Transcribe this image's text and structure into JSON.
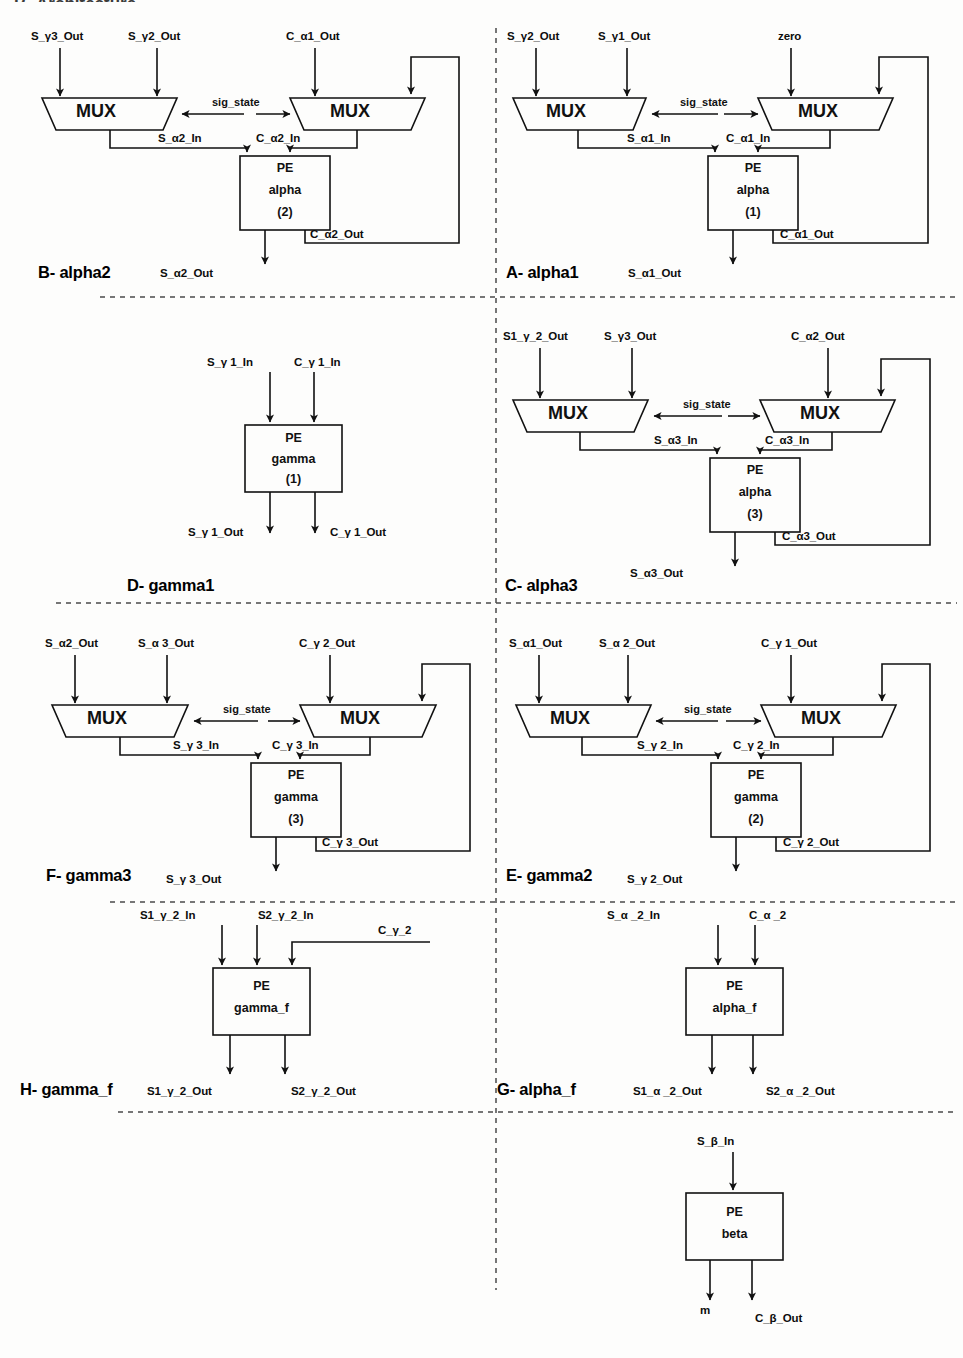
{
  "figure": {
    "title_clipped": "B-  Architecture",
    "background": "#fdfdfc",
    "line_color": "#111111",
    "divider_color": "#444444",
    "width": 963,
    "height": 1358
  },
  "common": {
    "mux_label": "MUX",
    "sig_state": "sig_state",
    "pe_label": "PE"
  },
  "panels": [
    {
      "id": "B",
      "name": "B- alpha2",
      "pe": {
        "line1": "PE",
        "line2": "alpha",
        "line3": "(2)"
      },
      "inputs_left_mux": [
        "S_γ3_Out",
        "S_γ2_Out"
      ],
      "inputs_right_mux": [
        "C_α1_Out"
      ],
      "mux_select": "sig_state",
      "pe_in_left": "S_α2_In",
      "pe_in_right": "C_α2_In",
      "pe_out_sum": "S_α2_Out",
      "pe_out_carry": "C_α2_Out",
      "has_feedback": true,
      "mux_count": 2
    },
    {
      "id": "A",
      "name": "A- alpha1",
      "pe": {
        "line1": "PE",
        "line2": "alpha",
        "line3": "(1)"
      },
      "inputs_left_mux": [
        "S_γ2_Out",
        "S_γ1_Out"
      ],
      "inputs_right_mux": [
        "zero"
      ],
      "mux_select": "sig_state",
      "pe_in_left": "S_α1_In",
      "pe_in_right": "C_α1_In",
      "pe_out_sum": "S_α1_Out",
      "pe_out_carry": "C_α1_Out",
      "has_feedback": true,
      "mux_count": 2
    },
    {
      "id": "D",
      "name": "D- gamma1",
      "pe": {
        "line1": "PE",
        "line2": "gamma",
        "line3": "(1)"
      },
      "pe_in_left": "S_γ 1_In",
      "pe_in_right": "C_γ 1_In",
      "pe_out_sum": "S_γ 1_Out",
      "pe_out_carry": "C_γ 1_Out",
      "has_feedback": false,
      "mux_count": 0
    },
    {
      "id": "C",
      "name": "C- alpha3",
      "pe": {
        "line1": "PE",
        "line2": "alpha",
        "line3": "(3)"
      },
      "inputs_left_mux": [
        "S1_γ_2_Out",
        "S_γ3_Out"
      ],
      "inputs_right_mux": [
        "C_α2_Out"
      ],
      "mux_select": "sig_state",
      "pe_in_left": "S_α3_In",
      "pe_in_right": "C_α3_In",
      "pe_out_sum": "S_α3_Out",
      "pe_out_carry": "C_α3_Out",
      "has_feedback": true,
      "mux_count": 2
    },
    {
      "id": "F",
      "name": "F- gamma3",
      "pe": {
        "line1": "PE",
        "line2": "gamma",
        "line3": "(3)"
      },
      "inputs_left_mux": [
        "S_α2_Out",
        "S_α 3_Out"
      ],
      "inputs_right_mux": [
        "C_γ 2_Out"
      ],
      "mux_select": "sig_state",
      "pe_in_left": "S_γ 3_In",
      "pe_in_right": "C_γ 3_In",
      "pe_out_sum": "S_γ 3_Out",
      "pe_out_carry": "C_γ 3_Out",
      "has_feedback": true,
      "mux_count": 2
    },
    {
      "id": "E",
      "name": "E- gamma2",
      "pe": {
        "line1": "PE",
        "line2": "gamma",
        "line3": "(2)"
      },
      "inputs_left_mux": [
        "S_α1_Out",
        "S_α 2_Out"
      ],
      "inputs_right_mux": [
        "C_γ 1_Out"
      ],
      "mux_select": "sig_state",
      "pe_in_left": "S_γ 2_In",
      "pe_in_right": "C_γ 2_In",
      "pe_out_sum": "S_γ 2_Out",
      "pe_out_carry": "C_γ 2_Out",
      "has_feedback": true,
      "mux_count": 2
    },
    {
      "id": "H",
      "name": "H- gamma_f",
      "pe": {
        "line1": "PE",
        "line2": "gamma_f",
        "line3": ""
      },
      "pe_in_1": "S1_γ_2_In",
      "pe_in_2": "S2_γ_2_In",
      "pe_in_3": "C_γ_2",
      "pe_out_1": "S1_γ_2_Out",
      "pe_out_2": "S2_γ_2_Out",
      "has_feedback": false,
      "mux_count": 0
    },
    {
      "id": "G",
      "name": "G- alpha_f",
      "pe": {
        "line1": "PE",
        "line2": "alpha_f",
        "line3": ""
      },
      "pe_in_1": "S_α _2_In",
      "pe_in_2": "C_α _2",
      "pe_out_1": "S1_α _2_Out",
      "pe_out_2": "S2_α _2_Out",
      "has_feedback": false,
      "mux_count": 0
    },
    {
      "id": "I",
      "name": "",
      "pe": {
        "line1": "PE",
        "line2": "beta",
        "line3": ""
      },
      "pe_in_1": "S_β_In",
      "pe_out_1": "m",
      "pe_out_2": "C_β_Out",
      "has_feedback": false,
      "mux_count": 0
    }
  ]
}
